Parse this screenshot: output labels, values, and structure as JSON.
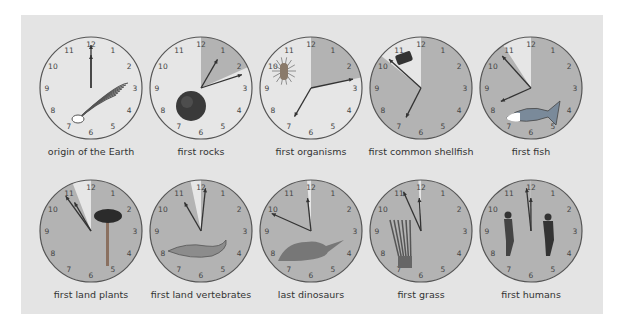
{
  "diagram": {
    "colors": {
      "panel_bg": "#e4e4e4",
      "face_light": "#e6e6e6",
      "face_shaded": "#b3b3b3",
      "rim": "#555555",
      "hand": "#333333",
      "numeral": "#444444",
      "label": "#333333"
    },
    "numerals": [
      "12",
      "1",
      "2",
      "3",
      "4",
      "5",
      "6",
      "7",
      "8",
      "9",
      "10",
      "11"
    ],
    "clocks": [
      {
        "label": "origin of the Earth",
        "shaded_from": 0,
        "shaded_to": 0,
        "hour_hand": 12.0,
        "minute_hand": 0,
        "icon": "comet-icon",
        "row": 0,
        "col": 0
      },
      {
        "label": "first rocks",
        "shaded_from": 0,
        "shaded_to": 2.2,
        "hour_hand": 1.0,
        "minute_hand": 12,
        "icon": "planet-icon",
        "row": 0,
        "col": 1
      },
      {
        "label": "first organisms",
        "shaded_from": 0,
        "shaded_to": 2.6,
        "hour_hand": 7.0,
        "minute_hand": 13,
        "icon": "bacterium-icon",
        "row": 0,
        "col": 2
      },
      {
        "label": "first common shellfish",
        "shaded_from": 0,
        "shaded_to": 10.3,
        "hour_hand": 6.9,
        "minute_hand": 52,
        "icon": "shellfish-icon",
        "row": 0,
        "col": 3
      },
      {
        "label": "first fish",
        "shaded_from": 0,
        "shaded_to": 10.9,
        "hour_hand": 8.2,
        "minute_hand": 53,
        "icon": "fish-icon",
        "row": 0,
        "col": 4
      },
      {
        "label": "first land plants",
        "shaded_from": 0,
        "shaded_to": 11.3,
        "hour_hand": 11.0,
        "minute_hand": 54,
        "icon": "tree-icon",
        "row": 1,
        "col": 0
      },
      {
        "label": "first land vertebrates",
        "shaded_from": 0,
        "shaded_to": 11.6,
        "hour_hand": 11.0,
        "minute_hand": 1,
        "icon": "lizard-icon",
        "row": 1,
        "col": 1
      },
      {
        "label": "last dinosaurs",
        "shaded_from": 0,
        "shaded_to": 11.85,
        "hour_hand": 11.8,
        "minute_hand": 49,
        "icon": "dinosaur-icon",
        "row": 1,
        "col": 2
      },
      {
        "label": "first grass",
        "shaded_from": 0,
        "shaded_to": 11.9,
        "hour_hand": 11.9,
        "minute_hand": 56,
        "icon": "grass-icon",
        "row": 1,
        "col": 3
      },
      {
        "label": "first humans",
        "shaded_from": 0,
        "shaded_to": 11.99,
        "hour_hand": 11.99,
        "minute_hand": 59,
        "icon": "runners-icon",
        "row": 1,
        "col": 4
      }
    ]
  }
}
